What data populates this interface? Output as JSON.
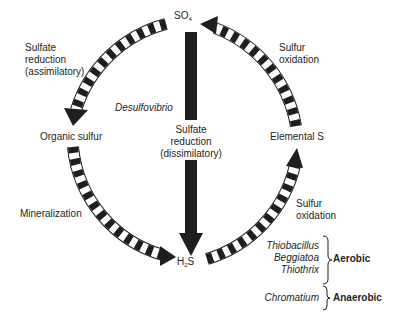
{
  "nodes": {
    "so4": {
      "label": "SO",
      "sub": "4"
    },
    "organic": {
      "label": "Organic sulfur"
    },
    "elemental": {
      "label": "Elemental S"
    },
    "h2s": {
      "pre": "H",
      "sub": "2",
      "post": "S"
    }
  },
  "processes": {
    "assimilatory": {
      "line1": "Sulfate",
      "line2": "reduction",
      "line3": "(assimilatory)"
    },
    "dissimilatory": {
      "organism": "Desulfovibrio",
      "line1": "Sulfate",
      "line2": "reduction",
      "line3": "(dissimilatory)"
    },
    "mineralization": {
      "label": "Mineralization"
    },
    "oxidation_top": {
      "line1": "Sulfur",
      "line2": "oxidation"
    },
    "oxidation_bottom": {
      "line1": "Sulfur",
      "line2": "oxidation"
    }
  },
  "organisms": {
    "aerobic": {
      "names": [
        "Thiobacillus",
        "Beggiatoa",
        "Thiothrix"
      ],
      "label": "Aerobic"
    },
    "anaerobic": {
      "names": [
        "Chromatium"
      ],
      "label": "Anaerobic"
    }
  },
  "colors": {
    "ink": "#1e1e1e",
    "background": "#ffffff"
  }
}
